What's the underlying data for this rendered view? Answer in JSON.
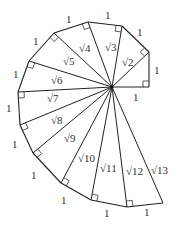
{
  "diagram": {
    "center": [
      112,
      87
    ],
    "vertices": [
      [
        149,
        87
      ],
      [
        149,
        52
      ],
      [
        122,
        26
      ],
      [
        88,
        22
      ],
      [
        54,
        33
      ],
      [
        29,
        61
      ],
      [
        18,
        92
      ],
      [
        20,
        125
      ],
      [
        33,
        153
      ],
      [
        61,
        183
      ],
      [
        91,
        200
      ],
      [
        127,
        207
      ],
      [
        163,
        203
      ]
    ],
    "hypotenuse_labels": [
      {
        "text": "√2",
        "x": 122,
        "y": 66
      },
      {
        "text": "√3",
        "x": 105,
        "y": 51
      },
      {
        "text": "√4",
        "x": 79,
        "y": 52
      },
      {
        "text": "√5",
        "x": 63,
        "y": 65
      },
      {
        "text": "√6",
        "x": 51,
        "y": 84
      },
      {
        "text": "√7",
        "x": 47,
        "y": 102
      },
      {
        "text": "√8",
        "x": 51,
        "y": 124
      },
      {
        "text": "√9",
        "x": 64,
        "y": 142
      },
      {
        "text": "√10",
        "x": 78,
        "y": 162
      },
      {
        "text": "√11",
        "x": 100,
        "y": 172
      },
      {
        "text": "√12",
        "x": 126,
        "y": 175
      },
      {
        "text": "√13",
        "x": 151,
        "y": 174
      }
    ],
    "unit_labels": [
      {
        "text": "1",
        "x": 133,
        "y": 101
      },
      {
        "text": "1",
        "x": 154,
        "y": 74
      },
      {
        "text": "1",
        "x": 137,
        "y": 36
      },
      {
        "text": "1",
        "x": 105,
        "y": 19
      },
      {
        "text": "1",
        "x": 66,
        "y": 23
      },
      {
        "text": "1",
        "x": 33,
        "y": 45
      },
      {
        "text": "1",
        "x": 13,
        "y": 78
      },
      {
        "text": "1",
        "x": 6,
        "y": 112
      },
      {
        "text": "1",
        "x": 12,
        "y": 148
      },
      {
        "text": "1",
        "x": 31,
        "y": 179
      },
      {
        "text": "1",
        "x": 61,
        "y": 204
      },
      {
        "text": "1",
        "x": 104,
        "y": 217
      },
      {
        "text": "1",
        "x": 144,
        "y": 216
      }
    ]
  }
}
